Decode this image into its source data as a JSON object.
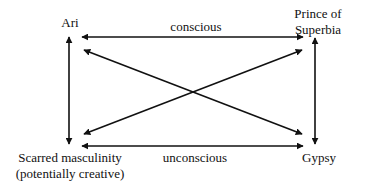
{
  "diagram": {
    "nodes": {
      "ari": {
        "label": "Ari"
      },
      "prince": {
        "line1": "Prince of",
        "line2": "Superbia"
      },
      "scarred": {
        "line1": "Scarred masculinity",
        "line2": "(potentially creative)"
      },
      "gypsy": {
        "label": "Gypsy"
      }
    },
    "edge_labels": {
      "top": "conscious",
      "bottom": "unconscious"
    },
    "edges": [
      {
        "from": "Ari",
        "to": "Prince of Superbia",
        "type": "bidirectional",
        "label": "conscious"
      },
      {
        "from": "Scarred masculinity",
        "to": "Gypsy",
        "type": "bidirectional",
        "label": "unconscious"
      },
      {
        "from": "Ari",
        "to": "Scarred masculinity",
        "type": "bidirectional"
      },
      {
        "from": "Prince of Superbia",
        "to": "Gypsy",
        "type": "bidirectional"
      },
      {
        "from": "Ari",
        "to": "Gypsy",
        "type": "bidirectional"
      },
      {
        "from": "Prince of Superbia",
        "to": "Scarred masculinity",
        "type": "bidirectional"
      }
    ],
    "colors": {
      "line": "#111111",
      "text": "#111111",
      "background": "#ffffff"
    }
  }
}
